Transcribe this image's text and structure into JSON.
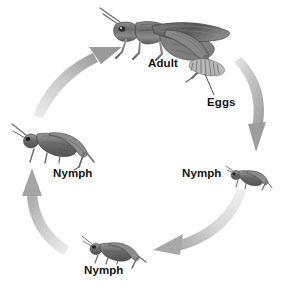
{
  "diagram": {
    "background_color": "#ffffff",
    "label_color": "#141414",
    "arrow_color": "#b5b5b5",
    "illustration_style": "grayscale engraving"
  },
  "labels": {
    "adult": "Adult",
    "eggs": "Eggs",
    "nymph_right": "Nymph",
    "nymph_left": "Nymph",
    "nymph_bottom": "Nymph"
  },
  "stages": [
    {
      "name": "adult",
      "label": "Adult",
      "position": "top",
      "size": "large"
    },
    {
      "name": "eggs",
      "label": "Eggs",
      "position": "top-right",
      "size": "tiny"
    },
    {
      "name": "nymph-right",
      "label": "Nymph",
      "position": "right",
      "size": "small"
    },
    {
      "name": "nymph-bottom",
      "label": "Nymph",
      "position": "bottom",
      "size": "medium"
    },
    {
      "name": "nymph-left",
      "label": "Nymph",
      "position": "left",
      "size": "large"
    }
  ],
  "arrows": [
    {
      "name": "arrow-adult-to-eggs",
      "from": "adult",
      "to": "nymph-right",
      "direction": "clockwise-down-right"
    },
    {
      "name": "arrow-nymph-right-to-bottom",
      "from": "nymph-right",
      "to": "nymph-bottom",
      "direction": "clockwise-down-left"
    },
    {
      "name": "arrow-nymph-bottom-to-left",
      "from": "nymph-bottom",
      "to": "nymph-left",
      "direction": "clockwise-up-left"
    },
    {
      "name": "arrow-nymph-left-to-adult",
      "from": "nymph-left",
      "to": "adult",
      "direction": "clockwise-up-right"
    }
  ],
  "leader_lines": [
    {
      "name": "eggs-leader-line",
      "from": "eggs-label",
      "to": "egg-cluster"
    }
  ]
}
